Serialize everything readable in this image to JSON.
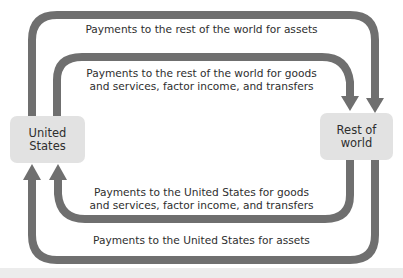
{
  "diagram": {
    "type": "circular-flow",
    "colors": {
      "arrow": "#6f6f6f",
      "node_fill": "#e2e2e2",
      "text": "#2e2e2e",
      "background": "#ffffff"
    },
    "nodes": {
      "us": {
        "line1": "United",
        "line2": "States"
      },
      "row": {
        "line1": "Rest of",
        "line2": "world"
      }
    },
    "flows": {
      "outer_top": {
        "text": "Payments to the rest of the world for assets",
        "from": "United States",
        "to": "Rest of world"
      },
      "inner_top": {
        "line1": "Payments to the rest of the world for goods",
        "line2": "and services, factor income, and transfers",
        "from": "United States",
        "to": "Rest of world"
      },
      "inner_bottom": {
        "line1": "Payments to the United States for goods",
        "line2": "and services, factor income, and transfers",
        "from": "Rest of world",
        "to": "United States"
      },
      "outer_bottom": {
        "text": "Payments to the United States for assets",
        "from": "Rest of world",
        "to": "United States"
      }
    }
  }
}
